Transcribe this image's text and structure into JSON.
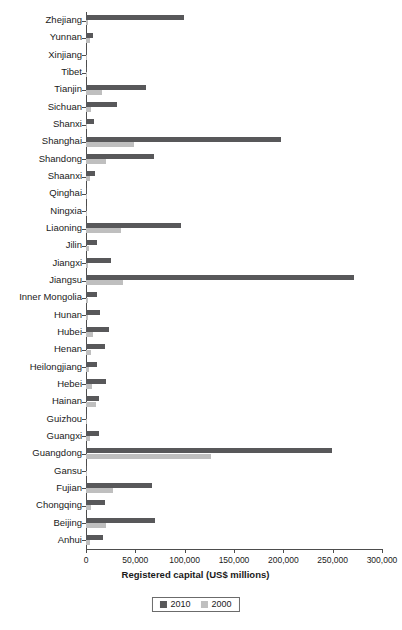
{
  "chart_data": {
    "type": "bar",
    "orientation": "horizontal",
    "title": "",
    "xlabel": "Registered capital (US$ millions)",
    "ylabel": "",
    "xlim": [
      0,
      300000
    ],
    "xticks": [
      0,
      50000,
      100000,
      150000,
      200000,
      250000,
      300000
    ],
    "xtick_labels": [
      "0",
      "50,000",
      "100,000",
      "150,000",
      "200,000",
      "250,000",
      "300,000"
    ],
    "grid": false,
    "legend_position": "bottom",
    "categories": [
      "Zhejiang",
      "Yunnan",
      "Xinjiang",
      "Tibet",
      "Tianjin",
      "Sichuan",
      "Shanxi",
      "Shanghai",
      "Shandong",
      "Shaanxi",
      "Qinghai",
      "Ningxia",
      "Liaoning",
      "Jilin",
      "Jiangxi",
      "Jiangsu",
      "Inner Mongolia",
      "Hunan",
      "Hubei",
      "Henan",
      "Heilongjiang",
      "Hebei",
      "Hainan",
      "Guizhou",
      "Guangxi",
      "Guangdong",
      "Gansu",
      "Fujian",
      "Chongqing",
      "Beijing",
      "Anhui"
    ],
    "series": [
      {
        "name": "2010",
        "color": "#58585a",
        "values": [
          99000,
          7500,
          1200,
          300,
          61000,
          31000,
          8000,
          198000,
          69000,
          9500,
          500,
          900,
          96000,
          11000,
          25000,
          272000,
          11000,
          14000,
          23000,
          19000,
          11000,
          20000,
          13000,
          1200,
          13000,
          249000,
          1500,
          67000,
          19000,
          70000,
          17000
        ]
      },
      {
        "name": "2000",
        "color": "#bfbfbf",
        "values": [
          2500,
          4500,
          700,
          100,
          16000,
          5500,
          1500,
          49000,
          20000,
          4000,
          200,
          500,
          35000,
          3500,
          2500,
          38000,
          2000,
          2500,
          7500,
          5500,
          3000,
          6000,
          10000,
          600,
          4000,
          127000,
          700,
          27000,
          5000,
          20000,
          4000
        ]
      }
    ]
  },
  "legend": {
    "items": [
      {
        "label": "2010",
        "color": "#58585a"
      },
      {
        "label": "2000",
        "color": "#bfbfbf"
      }
    ]
  }
}
